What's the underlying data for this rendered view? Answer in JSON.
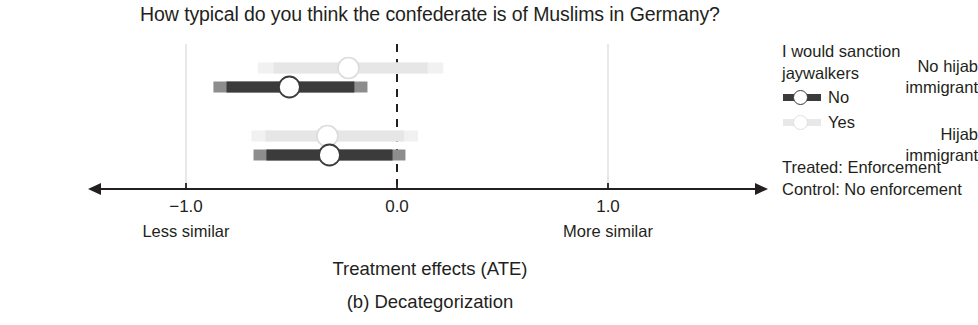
{
  "chart_data": {
    "type": "scatter",
    "title": "How typical do you think the confederate is of Muslims in Germany?",
    "xlabel": "Treatment effects (ATE)",
    "ylabel": "",
    "xlim": [
      -1.55,
      1.75
    ],
    "xticks": [
      -1.0,
      0.0,
      1.0
    ],
    "xticklabels": [
      "−1.0",
      "0.0",
      "1.0"
    ],
    "categories": [
      "No hijab immigrant",
      "Hijab immigrant"
    ],
    "grid": "vertical-light-at-xticks",
    "zero_line": {
      "value": 0.0,
      "style": "dashed",
      "color": "#231f20"
    },
    "legend": {
      "position": "right",
      "title": "I would sanction jaywalkers"
    },
    "axis_end_labels": {
      "left": "Less similar",
      "right": "More similar"
    },
    "series": [
      {
        "name": "No",
        "color": "#3b3b3b",
        "points": [
          {
            "category": "No hijab immigrant",
            "estimate": -0.51,
            "ci_low": -0.87,
            "ci_high": -0.14
          },
          {
            "category": "Hijab immigrant",
            "estimate": -0.32,
            "ci_low": -0.68,
            "ci_high": 0.04
          }
        ]
      },
      {
        "name": "Yes",
        "color": "#e8e8e8",
        "points": [
          {
            "category": "No hijab immigrant",
            "estimate": -0.23,
            "ci_low": -0.66,
            "ci_high": 0.22
          },
          {
            "category": "Hijab immigrant",
            "estimate": -0.33,
            "ci_low": -0.69,
            "ci_high": 0.1
          }
        ]
      }
    ]
  },
  "title": "How typical do you think the confederate is of Muslims in Germany?",
  "categories": [
    {
      "line1": "No hijab",
      "line2": "immigrant"
    },
    {
      "line1": "Hijab",
      "line2": "immigrant"
    }
  ],
  "axis": {
    "ticks": [
      "−1.0",
      "0.0",
      "1.0"
    ],
    "left_end_label": "Less similar",
    "right_end_label": "More similar"
  },
  "legend": {
    "title_line1": "I would sanction",
    "title_line2": "jaywalkers",
    "items": [
      {
        "label": "No",
        "color": "#3b3b3b"
      },
      {
        "label": "Yes",
        "color": "#e8e8e8"
      }
    ]
  },
  "notes": [
    "Treated: Enforcement",
    "Control: No enforcement"
  ],
  "captions": {
    "axis_title": "Treatment effects (ATE)",
    "panel": "(b) Decategorization"
  }
}
